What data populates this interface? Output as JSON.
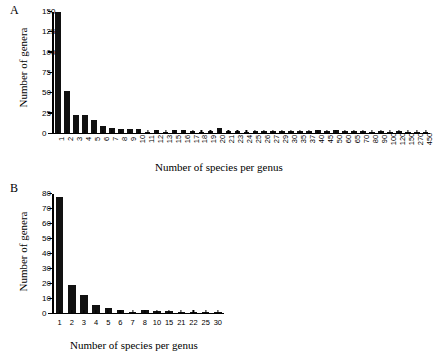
{
  "figure": {
    "panels": [
      {
        "label": "A",
        "xlabel": "Number of species per genus",
        "ylabel": "Number of genera"
      },
      {
        "label": "B",
        "xlabel": "Number of species per genus",
        "ylabel": "Number of genera"
      }
    ]
  },
  "chart_data": [
    {
      "type": "bar",
      "title": "A",
      "xlabel": "Number of species per genus",
      "ylabel": "Number of genera",
      "ylim": [
        0,
        150
      ],
      "yticks": [
        0,
        25,
        50,
        75,
        100,
        125,
        150
      ],
      "grid": false,
      "legend": null,
      "bar_color": "#111111",
      "categories": [
        "1",
        "2",
        "3",
        "4",
        "5",
        "6",
        "7",
        "8",
        "9",
        "10",
        "11",
        "12",
        "13",
        "15",
        "16",
        "17",
        "18",
        "19",
        "20",
        "21",
        "23",
        "24",
        "25",
        "26",
        "27",
        "29",
        "30",
        "35",
        "37",
        "40",
        "45",
        "50",
        "60",
        "65",
        "70",
        "80",
        "90",
        "100",
        "120",
        "150",
        "270",
        "450"
      ],
      "values": [
        150,
        52,
        22,
        22,
        15,
        8,
        6,
        4,
        4,
        4,
        1,
        3,
        1,
        3,
        3,
        2,
        1,
        2,
        5,
        2,
        2,
        1,
        2,
        2,
        2,
        2,
        2,
        2,
        2,
        3,
        2,
        3,
        2,
        2,
        2,
        1,
        2,
        1,
        2,
        1,
        1,
        1
      ]
    },
    {
      "type": "bar",
      "title": "B",
      "xlabel": "Number of species per genus",
      "ylabel": "Number of genera",
      "ylim": [
        0,
        80
      ],
      "yticks": [
        0,
        10,
        20,
        30,
        40,
        50,
        60,
        70,
        80
      ],
      "grid": false,
      "legend": null,
      "bar_color": "#111111",
      "categories": [
        "1",
        "2",
        "3",
        "4",
        "5",
        "6",
        "7",
        "8",
        "10",
        "15",
        "21",
        "22",
        "25",
        "30"
      ],
      "values": [
        78,
        18.5,
        11.5,
        5,
        3,
        2,
        0.6,
        2,
        1,
        1,
        0.6,
        0.6,
        0.6,
        0.6
      ]
    }
  ]
}
